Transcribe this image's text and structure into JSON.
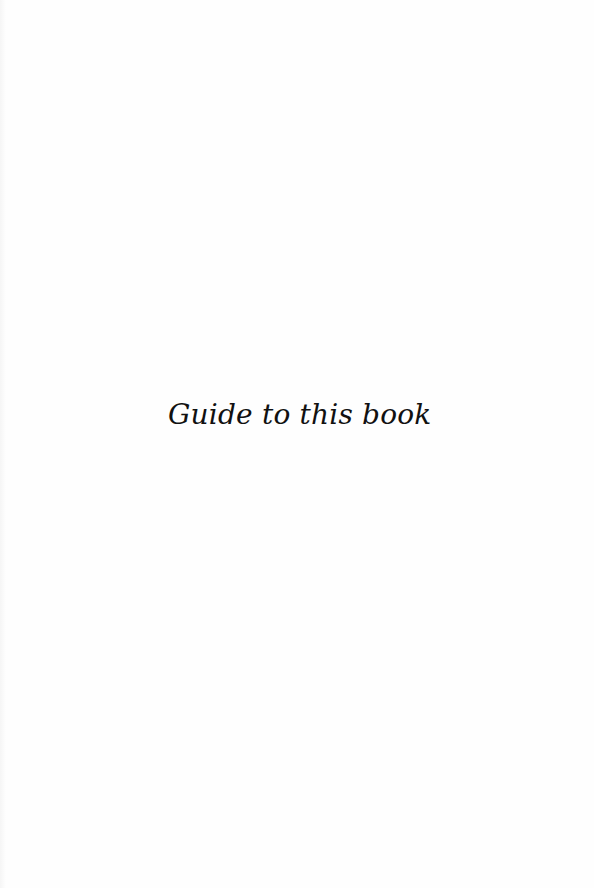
{
  "page": {
    "title": "Guide to this book",
    "background_color": "#fefefe",
    "text_color": "#111111"
  }
}
